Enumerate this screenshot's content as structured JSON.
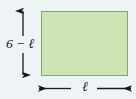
{
  "figure": {
    "background_color": "#eef4f6",
    "shape": {
      "type": "rectangle",
      "fill_color": "#cfe4b4",
      "stroke_color": "#7fa86a"
    },
    "vertical_dimension": {
      "label": "6 − ℓ",
      "arrow_style": "double-headed-outward",
      "orientation": "vertical",
      "color": "#1a1a1a"
    },
    "horizontal_dimension": {
      "label": "ℓ",
      "arrow_style": "double-headed-outward",
      "orientation": "horizontal",
      "color": "#1a1a1a"
    }
  }
}
